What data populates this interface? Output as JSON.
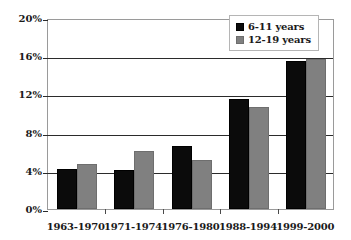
{
  "chart_data": {
    "type": "bar",
    "title": "",
    "subtitle": "",
    "xlabel": "",
    "ylabel": "",
    "categories": [
      "1963-1970",
      "1971-1974",
      "1976-1980",
      "1988-1994",
      "1999-2000"
    ],
    "series": [
      {
        "name": "6-11 years",
        "color": "#0b0b0b",
        "values": [
          4.2,
          4.1,
          6.6,
          11.5,
          15.5
        ]
      },
      {
        "name": "12-19 years",
        "color": "#808080",
        "values": [
          4.7,
          6.1,
          5.1,
          10.7,
          15.7
        ]
      }
    ],
    "ylim": [
      0,
      20
    ],
    "yticks": [
      0,
      4,
      8,
      12,
      16,
      20
    ],
    "ytick_labels": [
      "0%",
      "4%",
      "8%",
      "12%",
      "16%",
      "20%"
    ],
    "grid": true,
    "grid_axis": "y",
    "legend": {
      "position": "top-right",
      "entries": [
        "6-11 years",
        "12-19 years"
      ]
    },
    "annotations": [],
    "value_suffix": "%"
  }
}
